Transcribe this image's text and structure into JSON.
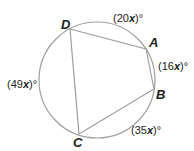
{
  "diagram": {
    "circle": {
      "cx": 97,
      "cy": 80,
      "r": 58,
      "stroke": "#a0a0a0"
    },
    "polygon_stroke": "#a0a0a0",
    "vertices": [
      {
        "name": "A",
        "x": 146,
        "y": 49,
        "label_x": 149,
        "label_y": 47
      },
      {
        "name": "B",
        "x": 154,
        "y": 89,
        "label_x": 156,
        "label_y": 99
      },
      {
        "name": "C",
        "x": 79,
        "y": 134,
        "label_x": 73,
        "label_y": 147
      },
      {
        "name": "D",
        "x": 70,
        "y": 29,
        "label_x": 61,
        "label_y": 29
      }
    ],
    "arcs": [
      {
        "label_num": "(20",
        "label_var": "x",
        "label_end": ")°",
        "x": 113,
        "y": 22
      },
      {
        "label_num": "(16",
        "label_var": "x",
        "label_end": ")°",
        "x": 158,
        "y": 70
      },
      {
        "label_num": "(35",
        "label_var": "x",
        "label_end": ")°",
        "x": 131,
        "y": 134
      },
      {
        "label_num": "(49",
        "label_var": "x",
        "label_end": ")°",
        "x": 7,
        "y": 88
      }
    ]
  }
}
